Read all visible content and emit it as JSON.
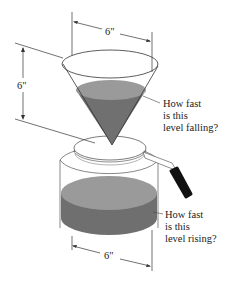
{
  "diagram": {
    "type": "related-rates coffee filter cone and pot",
    "dimensions": {
      "cone_top_diameter": "6\"",
      "cone_height": "6\"",
      "pot_diameter": "6\""
    },
    "labels": {
      "cone_question": [
        "How fast",
        "is this",
        "level falling?"
      ],
      "pot_question": [
        "How fast",
        "is this",
        "level rising?"
      ]
    },
    "colors": {
      "liquid_top": "#9a9a9a",
      "liquid_side": "#6f6f6f",
      "cone_liquid": "#707070",
      "outline": "#333333",
      "handle_grip": "#111111",
      "background": "#ffffff"
    }
  }
}
